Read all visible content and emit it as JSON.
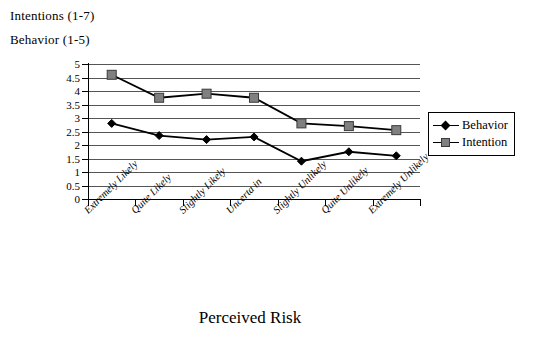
{
  "header": {
    "line1": "Intentions (1-7)",
    "line2": "Behavior (1-5)"
  },
  "legend": {
    "items": [
      {
        "label": "Behavior",
        "marker": "diamond-marker",
        "color": "#000000"
      },
      {
        "label": "Intention",
        "marker": "square-marker",
        "color": "#808080"
      }
    ]
  },
  "chart_data": {
    "type": "line",
    "title": "",
    "xlabel": "Perceived Risk",
    "ylabel": "",
    "ylim": [
      0,
      5
    ],
    "yticks": [
      "0",
      "0.5",
      "1",
      "1.5",
      "2",
      "2.5",
      "3",
      "3.5",
      "4",
      "4.5",
      "5"
    ],
    "grid": true,
    "legend_position": "right",
    "categories": [
      "Extremely Likely",
      "Quite Likely",
      "Slightly Likely",
      "Uncerta in",
      "Slightly Unlikely",
      "Quite Unlikely",
      "Extremely Unlikely"
    ],
    "series": [
      {
        "name": "Behavior",
        "values": [
          2.8,
          2.35,
          2.2,
          2.3,
          1.4,
          1.75,
          1.6
        ]
      },
      {
        "name": "Intention",
        "values": [
          4.6,
          3.75,
          3.9,
          3.75,
          2.8,
          2.7,
          2.55
        ]
      }
    ]
  }
}
